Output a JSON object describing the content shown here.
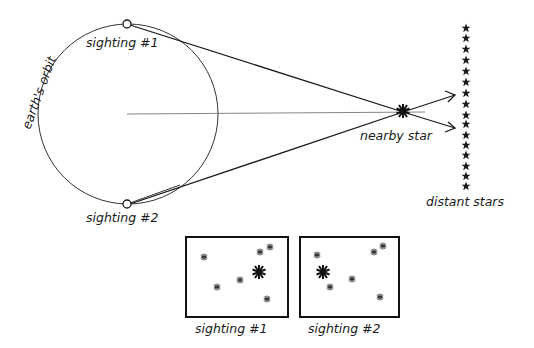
{
  "diagram": {
    "labels": {
      "orbit": "earth's orbit",
      "sighting1": "sighting #1",
      "sighting2": "sighting #2",
      "nearby_star": "nearby star",
      "distant_stars": "distant stars",
      "panel1_caption": "sighting #1",
      "panel2_caption": "sighting #2"
    },
    "distant_star_count": 16,
    "colors": {
      "ink": "#1a1a1a",
      "background": "#ffffff"
    }
  }
}
